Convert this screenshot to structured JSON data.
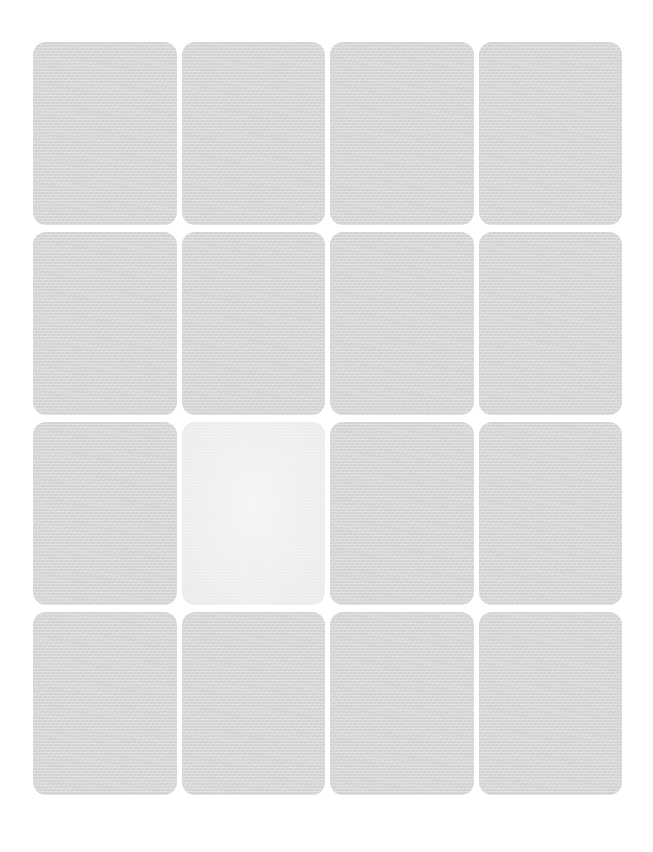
{
  "page": {
    "background_color": "#ffffff",
    "width": 653,
    "height": 852
  },
  "grid": {
    "columns": 4,
    "rows": 4,
    "column_gap": 5,
    "row_gap": 7,
    "tile_radius": 13,
    "tile_color": "#d5d5d5",
    "highlight_color": "#f1f1f1",
    "highlighted_index": 9,
    "tiles": [
      {
        "id": "tile-1",
        "row": 1,
        "col": 1,
        "label": "",
        "state": "default"
      },
      {
        "id": "tile-2",
        "row": 1,
        "col": 2,
        "label": "",
        "state": "default"
      },
      {
        "id": "tile-3",
        "row": 1,
        "col": 3,
        "label": "",
        "state": "default"
      },
      {
        "id": "tile-4",
        "row": 1,
        "col": 4,
        "label": "",
        "state": "default"
      },
      {
        "id": "tile-5",
        "row": 2,
        "col": 1,
        "label": "",
        "state": "default"
      },
      {
        "id": "tile-6",
        "row": 2,
        "col": 2,
        "label": "",
        "state": "default"
      },
      {
        "id": "tile-7",
        "row": 2,
        "col": 3,
        "label": "",
        "state": "default"
      },
      {
        "id": "tile-8",
        "row": 2,
        "col": 4,
        "label": "",
        "state": "default"
      },
      {
        "id": "tile-9",
        "row": 3,
        "col": 1,
        "label": "",
        "state": "default"
      },
      {
        "id": "tile-10",
        "row": 3,
        "col": 2,
        "label": "",
        "state": "highlighted"
      },
      {
        "id": "tile-11",
        "row": 3,
        "col": 3,
        "label": "",
        "state": "default"
      },
      {
        "id": "tile-12",
        "row": 3,
        "col": 4,
        "label": "",
        "state": "default"
      },
      {
        "id": "tile-13",
        "row": 4,
        "col": 1,
        "label": "",
        "state": "default"
      },
      {
        "id": "tile-14",
        "row": 4,
        "col": 2,
        "label": "",
        "state": "default"
      },
      {
        "id": "tile-15",
        "row": 4,
        "col": 3,
        "label": "",
        "state": "default"
      },
      {
        "id": "tile-16",
        "row": 4,
        "col": 4,
        "label": "",
        "state": "default"
      }
    ]
  }
}
